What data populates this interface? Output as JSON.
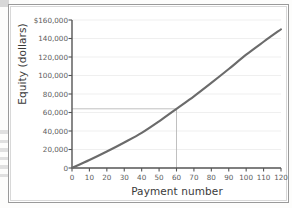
{
  "chart_data": {
    "type": "line",
    "title": "",
    "xlabel": "Payment number",
    "ylabel": "Equity (dollars)",
    "xlim": [
      0,
      120
    ],
    "ylim": [
      0,
      160000
    ],
    "grid": true,
    "legend": "none",
    "x_ticks": [
      "0",
      "10",
      "20",
      "30",
      "40",
      "50",
      "60",
      "70",
      "80",
      "90",
      "100",
      "110",
      "120"
    ],
    "x_tick_values": [
      0,
      10,
      20,
      30,
      40,
      50,
      60,
      70,
      80,
      90,
      100,
      110,
      120
    ],
    "y_ticks": [
      "0",
      "20,000",
      "40,000",
      "60,000",
      "80,000",
      "100,000",
      "120,000",
      "140,000",
      "$160,000"
    ],
    "y_tick_values": [
      0,
      20000,
      40000,
      60000,
      80000,
      100000,
      120000,
      140000,
      160000
    ],
    "series": [
      {
        "name": "Equity",
        "color": "#6b6b6b",
        "x": [
          0,
          10,
          20,
          30,
          40,
          50,
          60,
          70,
          80,
          90,
          100,
          110,
          120
        ],
        "values": [
          0,
          8600,
          17800,
          27600,
          38000,
          50500,
          64000,
          77500,
          92000,
          107000,
          122500,
          136500,
          150000
        ]
      }
    ],
    "annotations": [
      {
        "name": "reference-lines",
        "type": "crosshair",
        "x": 60,
        "y": 64000,
        "color": "#b0b0b0"
      }
    ]
  }
}
